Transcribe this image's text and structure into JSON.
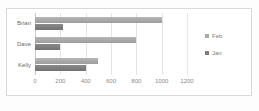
{
  "chart_data": {
    "type": "bar",
    "orientation": "horizontal",
    "title": "",
    "xlabel": "",
    "ylabel": "",
    "categories": [
      "Brian",
      "Dave",
      "Kelly"
    ],
    "series": [
      {
        "name": "Feb",
        "color": "#a8a8a8",
        "values": [
          1000,
          800,
          500
        ]
      },
      {
        "name": "Jan",
        "color": "#7d7d7d",
        "values": [
          220,
          200,
          400
        ]
      }
    ],
    "xlim": [
      0,
      1200
    ],
    "xticks": [
      0,
      200,
      400,
      600,
      800,
      1000,
      1200
    ],
    "xtick_labels": [
      "0",
      "200",
      "400",
      "600",
      "800",
      "1000",
      "1200"
    ],
    "grid": true,
    "legend": {
      "position": "right",
      "entries": [
        {
          "label": "Feb",
          "color": "#a8a8a8"
        },
        {
          "label": "Jan",
          "color": "#7d7d7d"
        }
      ]
    }
  }
}
